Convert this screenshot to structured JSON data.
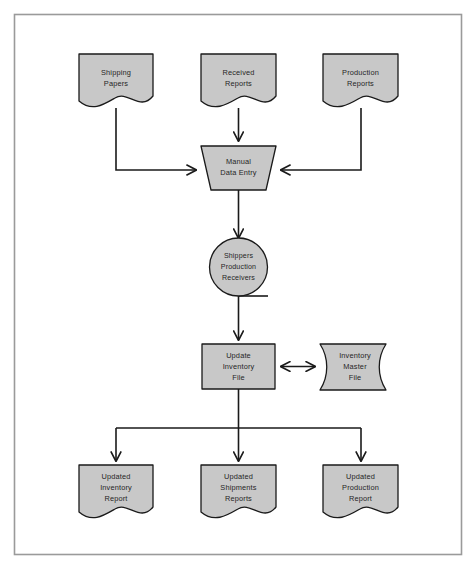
{
  "diagram": {
    "border_color": "#9a9a9a",
    "shape_fill": "#c8c8c8",
    "shape_stroke": "#1a1a1a",
    "connector_color": "#1a1a1a",
    "background": "#ffffff"
  },
  "nodes": {
    "shipping_papers": {
      "shape": "document",
      "line1": "Shipping",
      "line2": "Papers"
    },
    "received_reports": {
      "shape": "document",
      "line1": "Received",
      "line2": "Reports"
    },
    "production_reports": {
      "shape": "document",
      "line1": "Production",
      "line2": "Reports"
    },
    "manual_data_entry": {
      "shape": "manual-operation-trapezoid",
      "line1": "Manual",
      "line2": "Data Entry"
    },
    "shippers_production_receivers": {
      "shape": "circle-connector",
      "line1": "Shippers",
      "line2": "Production",
      "line3": "Receivers"
    },
    "update_inventory_file": {
      "shape": "process-rectangle",
      "line1": "Update",
      "line2": "Inventory",
      "line3": "File"
    },
    "inventory_master_file": {
      "shape": "stored-data",
      "line1": "Inventory",
      "line2": "Master",
      "line3": "File"
    },
    "updated_inventory_report": {
      "shape": "document",
      "line1": "Updated",
      "line2": "Inventory",
      "line3": "Report"
    },
    "updated_shipments_reports": {
      "shape": "document",
      "line1": "Updated",
      "line2": "Shipments",
      "line3": "Reports"
    },
    "updated_production_report": {
      "shape": "document",
      "line1": "Updated",
      "line2": "Production",
      "line3": "Report"
    }
  }
}
